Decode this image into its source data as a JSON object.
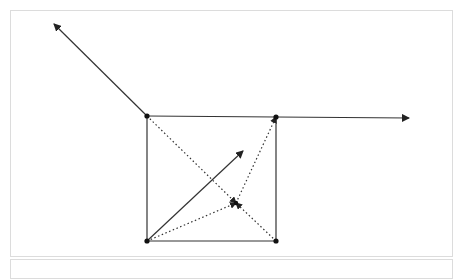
{
  "diagram": {
    "type": "vector-square-diagram",
    "colors": {
      "stroke": "#333333",
      "vertex": "#111111",
      "panel_border": "#dcdcdc",
      "background": "#ffffff"
    },
    "vertices": [
      {
        "id": "top-left",
        "x": 147,
        "y": 116
      },
      {
        "id": "top-right",
        "x": 276,
        "y": 117
      },
      {
        "id": "bottom-left",
        "x": 147,
        "y": 241
      },
      {
        "id": "bottom-right",
        "x": 276,
        "y": 241
      }
    ],
    "square_edges": [
      {
        "from": "top-left",
        "to": "top-right"
      },
      {
        "from": "top-right",
        "to": "bottom-right"
      },
      {
        "from": "bottom-right",
        "to": "bottom-left"
      },
      {
        "from": "bottom-left",
        "to": "top-left"
      }
    ],
    "solid_arrows": [
      {
        "id": "arrow-up-left",
        "x1": 147,
        "y1": 116,
        "x2": 54,
        "y2": 24
      },
      {
        "id": "arrow-right",
        "x1": 276,
        "y1": 117,
        "x2": 409,
        "y2": 118
      },
      {
        "id": "arrow-diagonal",
        "x1": 147,
        "y1": 241,
        "x2": 243,
        "y2": 151
      }
    ],
    "focal_point": {
      "x": 236,
      "y": 203
    },
    "dotted_arrows": [
      {
        "id": "dotted-from-top-left",
        "x1": 147,
        "y1": 116,
        "x2": 236,
        "y2": 203
      },
      {
        "id": "dotted-from-bottom-left",
        "x1": 147,
        "y1": 241,
        "x2": 236,
        "y2": 203
      },
      {
        "id": "dotted-from-bottom-right",
        "x1": 276,
        "y1": 241,
        "x2": 236,
        "y2": 203
      },
      {
        "id": "dotted-to-top-right",
        "x1": 236,
        "y1": 203,
        "x2": 276,
        "y2": 117
      }
    ]
  }
}
